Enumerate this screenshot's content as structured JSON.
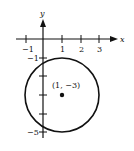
{
  "diagram": {
    "axes": {
      "x_label": "x",
      "y_label": "y",
      "x_ticks": [
        "-1",
        "1",
        "2",
        "3"
      ],
      "y_ticks": [
        "-1",
        "-5"
      ]
    },
    "circle": {
      "center": [
        1,
        -3
      ],
      "radius": 2,
      "center_label": "(1, −3)"
    },
    "tick_labels": {
      "x_neg1": "−1",
      "x_1": "1",
      "x_2": "2",
      "x_3": "3",
      "y_neg1": "−1",
      "y_neg5": "−5"
    },
    "colors": {
      "stroke": "#111111",
      "background": "#ffffff"
    }
  }
}
